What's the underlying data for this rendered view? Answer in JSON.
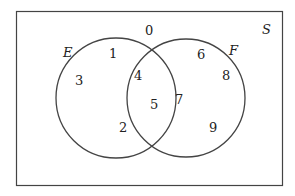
{
  "diagram": {
    "type": "venn",
    "universe_label": "S",
    "sets": [
      {
        "label": "E"
      },
      {
        "label": "F"
      }
    ],
    "elements": {
      "outside": [
        "0"
      ],
      "e_only": [
        "1",
        "3",
        "2"
      ],
      "both": [
        "4",
        "5"
      ],
      "f_only": [
        "6",
        "8",
        "7",
        "9"
      ]
    }
  },
  "labels": {
    "S": "S",
    "E": "E",
    "F": "F",
    "n0": "0",
    "n1": "1",
    "n2": "2",
    "n3": "3",
    "n4": "4",
    "n5": "5",
    "n6": "6",
    "n7": "7",
    "n8": "8",
    "n9": "9"
  }
}
